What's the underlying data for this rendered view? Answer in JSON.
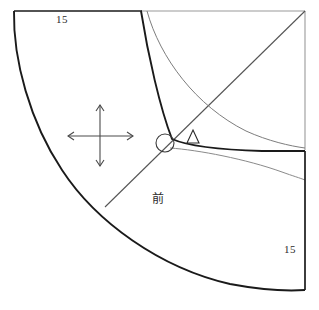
{
  "diagram": {
    "type": "sewing-pattern-draft",
    "background_color": "#ffffff",
    "ink_color": "#1a1a1a",
    "light_ink_color": "#8a8a8a",
    "labels": {
      "top_left_dimension": "15",
      "bottom_right_dimension": "15",
      "front_marker": "前"
    },
    "markers": {
      "grainline_cross": "four-way-arrow-cross",
      "notch_circle": "small-circle-marker",
      "notch_triangle": "small-triangle-marker"
    },
    "geometry": {
      "top_edge": {
        "x1": 14,
        "y1": 11,
        "x2": 305,
        "y2": 11
      },
      "top_edge_heavy_end_x": 141,
      "right_edge": {
        "x1": 305,
        "y1": 11,
        "x2": 305,
        "y2": 290
      },
      "waist_arc_start": {
        "x": 14,
        "y": 11
      },
      "waist_arc_end": {
        "x": 305,
        "y": 290
      },
      "diagonal_bias_line": {
        "x1": 305,
        "y1": 11,
        "x2": 105,
        "y2": 207
      },
      "inner_curve_heavy": {
        "start_x": 141,
        "start_y": 11,
        "end_x": 305,
        "end_y": 151
      },
      "inner_curve_light": {
        "start_x": 147,
        "start_y": 11,
        "end_x": 305,
        "end_y": 148
      },
      "hem_curve_light": {
        "start_x": 168,
        "start_y": 148,
        "end_x": 305,
        "end_y": 180
      },
      "cross_center": {
        "x": 100,
        "y": 136
      },
      "cross_h_span": [
        68,
        133
      ],
      "cross_v_span": [
        105,
        166
      ],
      "circle_marker": {
        "cx": 165,
        "cy": 143,
        "r": 9
      },
      "triangle_marker": {
        "cx": 193,
        "cy": 137,
        "size": 11
      }
    }
  }
}
